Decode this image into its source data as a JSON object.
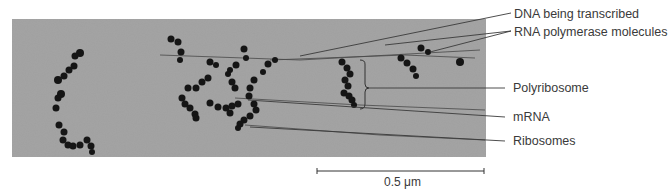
{
  "figure": {
    "labels": [
      {
        "id": "dna",
        "text": "DNA being transcribed"
      },
      {
        "id": "rna-polymerase",
        "text": "RNA polymerase molecules"
      },
      {
        "id": "polyribosome",
        "text": "Polyribosome"
      },
      {
        "id": "mrna",
        "text": "mRNA"
      },
      {
        "id": "ribosomes",
        "text": "Ribosomes"
      }
    ],
    "scale_bar": {
      "value": "0.5",
      "unit": "μm",
      "text": "0.5 μm"
    },
    "colors": {
      "background": "#ffffff",
      "micrograph": "#9a9a9a",
      "particles": "#151515",
      "leader_lines": "#3a3a3a",
      "label_text": "#3a3a3a"
    }
  }
}
